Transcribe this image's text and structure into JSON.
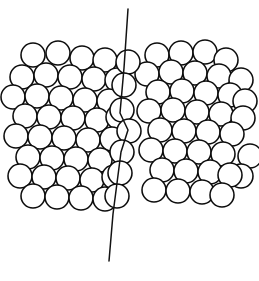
{
  "figure": {
    "background_color": "#ffffff",
    "stroke_color": "#0d0d0d",
    "line_color": "#121212",
    "width": 259,
    "height": 281
  },
  "chart_data": {
    "type": "scatter",
    "subtitle": "",
    "xlabel": "",
    "ylabel": "",
    "xlim": [
      0,
      259
    ],
    "ylim": [
      0,
      281
    ],
    "grid": false,
    "legend_position": "none",
    "marker": "open-circle",
    "marker_radius": 12.0,
    "annotations": [
      {
        "name": "grain-boundary-line",
        "type": "polyline",
        "points": [
          [
            128,
            9
          ],
          [
            124,
            68
          ],
          [
            120,
            113
          ],
          [
            128,
            130
          ],
          [
            121,
            152
          ],
          [
            113,
            214
          ],
          [
            109,
            261
          ]
        ]
      }
    ],
    "series": [
      {
        "name": "left-grain",
        "marker": "open-circle",
        "x": [
          33,
          58,
          82,
          105,
          22,
          46,
          70,
          94,
          117,
          13,
          37,
          61,
          85,
          109,
          25,
          49,
          73,
          97,
          118,
          16,
          40,
          64,
          88,
          112,
          28,
          52,
          76,
          100,
          20,
          44,
          68,
          92,
          114,
          33,
          57,
          81,
          105
        ],
        "y": [
          55,
          53,
          58,
          60,
          77,
          75,
          77,
          79,
          80,
          97,
          96,
          98,
          100,
          101,
          116,
          117,
          118,
          120,
          117,
          136,
          137,
          138,
          140,
          139,
          157,
          158,
          159,
          160,
          176,
          177,
          178,
          180,
          177,
          196,
          197,
          198,
          199
        ]
      },
      {
        "name": "right-grain",
        "marker": "open-circle",
        "x": [
          157,
          181,
          205,
          226,
          147,
          171,
          195,
          219,
          241,
          158,
          182,
          206,
          230,
          245,
          149,
          173,
          197,
          221,
          243,
          160,
          184,
          208,
          232,
          250,
          151,
          175,
          199,
          223,
          241,
          162,
          186,
          210,
          230,
          154,
          178,
          202,
          222
        ],
        "y": [
          55,
          53,
          52,
          60,
          74,
          72,
          73,
          76,
          80,
          92,
          91,
          93,
          95,
          101,
          111,
          110,
          112,
          114,
          118,
          130,
          131,
          132,
          134,
          156,
          150,
          151,
          152,
          154,
          176,
          170,
          171,
          172,
          175,
          190,
          191,
          192,
          195
        ]
      },
      {
        "name": "boundary-column",
        "marker": "open-circle",
        "x": [
          128,
          124,
          122,
          129,
          122,
          120,
          117
        ],
        "y": [
          62,
          85,
          110,
          131,
          152,
          173,
          196
        ]
      }
    ]
  }
}
